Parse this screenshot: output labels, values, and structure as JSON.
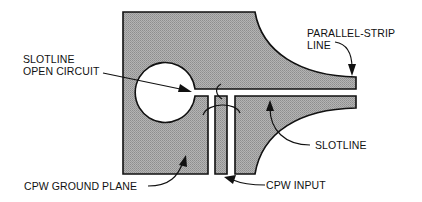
{
  "diagram": {
    "type": "CPW-to-slotline transition with parallel-strip line",
    "colors": {
      "metal_fill": "#a8a8a8",
      "outline": "#111111",
      "background": "#ffffff",
      "text": "#111111"
    },
    "labels": {
      "slotline_open_circuit_line1": "SLOTLINE",
      "slotline_open_circuit_line2": "OPEN CIRCUIT",
      "parallel_strip_line1": "PARALLEL-STRIP",
      "parallel_strip_line2": "LINE",
      "slotline": "SLOTLINE",
      "cpw_ground_plane": "CPW GROUND PLANE",
      "cpw_input": "CPW INPUT"
    }
  }
}
